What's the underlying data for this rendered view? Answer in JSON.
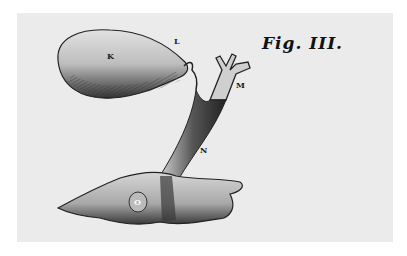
{
  "figure": {
    "title": "Fig. III.",
    "labels": {
      "K": "K",
      "L": "L",
      "M": "M",
      "N": "N",
      "O": "O"
    }
  }
}
